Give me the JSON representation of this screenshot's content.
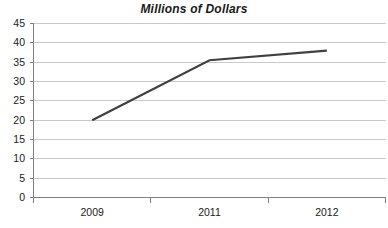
{
  "chart_data": {
    "type": "line",
    "title": "Millions of Dollars",
    "xlabel": "",
    "ylabel": "",
    "categories": [
      "2009",
      "2011",
      "2012"
    ],
    "values": [
      20,
      35.5,
      38
    ],
    "series": [
      {
        "name": "Millions of Dollars",
        "values": [
          20,
          35.5,
          38
        ],
        "color": "#404040"
      }
    ],
    "ylim": [
      0,
      45
    ],
    "yticks": [
      0,
      5,
      10,
      15,
      20,
      25,
      30,
      35,
      40,
      45
    ],
    "ytick_labels": [
      "0",
      "5",
      "10",
      "15",
      "20",
      "25",
      "30",
      "35",
      "40",
      "45"
    ],
    "xtick_labels": [
      "2009",
      "2011",
      "2012"
    ],
    "grid": true,
    "grid_axis": "y",
    "grid_color": "#c9c9c9",
    "axis_color": "#808080",
    "legend": false,
    "legend_position": "none",
    "markers": false,
    "background": "#ffffff"
  }
}
